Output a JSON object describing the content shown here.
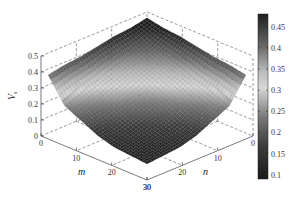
{
  "chart_data": {
    "type": "surface",
    "title": "",
    "xlabel": "m",
    "ylabel": "n",
    "zlabel": "V_s",
    "x_ticks": [
      0,
      10,
      20,
      30
    ],
    "y_ticks": [
      0,
      10,
      20,
      30
    ],
    "z_ticks": [
      0,
      0.1,
      0.2,
      0.3,
      0.4,
      0.5
    ],
    "xlim": [
      0,
      30
    ],
    "ylim": [
      0,
      30
    ],
    "zlim": [
      0,
      0.5
    ],
    "grid": true,
    "colorbar": {
      "ticks": [
        0.1,
        0.15,
        0.2,
        0.25,
        0.3,
        0.35,
        0.4,
        0.45
      ],
      "range": [
        0.09,
        0.48
      ],
      "colormap": "gray-cyclic"
    },
    "grid_m": [
      2,
      6.67,
      11.33,
      16,
      20.67,
      25.33,
      30
    ],
    "grid_n": [
      2,
      6.67,
      11.33,
      16,
      20.67,
      25.33,
      30
    ],
    "z": [
      [
        0.5,
        0.48,
        0.47,
        0.45,
        0.43,
        0.42,
        0.4
      ],
      [
        0.48,
        0.43,
        0.39,
        0.36,
        0.32,
        0.29,
        0.25
      ],
      [
        0.47,
        0.39,
        0.35,
        0.31,
        0.27,
        0.22,
        0.2
      ],
      [
        0.45,
        0.36,
        0.31,
        0.25,
        0.21,
        0.17,
        0.15
      ],
      [
        0.43,
        0.32,
        0.27,
        0.21,
        0.17,
        0.14,
        0.12
      ],
      [
        0.42,
        0.29,
        0.22,
        0.17,
        0.14,
        0.12,
        0.11
      ],
      [
        0.4,
        0.25,
        0.2,
        0.15,
        0.12,
        0.11,
        0.1
      ]
    ]
  },
  "labels": {
    "z_ticks": [
      "0",
      "0.1",
      "0.2",
      "0.3",
      "0.4",
      "0.5"
    ],
    "m_ticks": [
      "0",
      "10",
      "20",
      "30"
    ],
    "n_ticks": [
      "0",
      "10",
      "20",
      "30"
    ],
    "colorbar_ticks": [
      "0.1",
      "0.15",
      "0.2",
      "0.25",
      "0.3",
      "0.35",
      "0.4",
      "0.45"
    ],
    "m_axis": "m",
    "n_axis": "n",
    "z_axis_main": "V",
    "z_axis_sub": "s"
  }
}
